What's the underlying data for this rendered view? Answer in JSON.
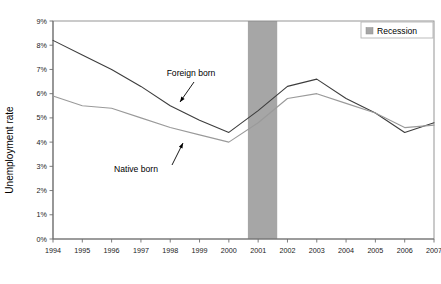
{
  "chart_data": {
    "type": "line",
    "title": "",
    "xlabel": "",
    "ylabel": "Unemployment rate",
    "x": [
      1994,
      1995,
      1996,
      1997,
      1998,
      1999,
      2000,
      2001,
      2002,
      2003,
      2004,
      2005,
      2006,
      2007
    ],
    "xtick_labels": [
      "1994",
      "1995",
      "1996",
      "1997",
      "1998",
      "1999",
      "2000",
      "2001",
      "2002",
      "2003",
      "2004",
      "2005",
      "2006",
      "2007"
    ],
    "ytick_labels": [
      "0%",
      "1%",
      "2%",
      "3%",
      "4%",
      "5%",
      "6%",
      "7%",
      "8%",
      "9%"
    ],
    "ytick_values": [
      0,
      1,
      2,
      3,
      4,
      5,
      6,
      7,
      8,
      9
    ],
    "ylim": [
      0,
      9
    ],
    "xlim": [
      1994,
      2007
    ],
    "grid": false,
    "legend_position": "top-right",
    "series": [
      {
        "name": "Foreign born",
        "color": "#3d3d3d",
        "values": [
          8.2,
          7.6,
          7.0,
          6.3,
          5.5,
          4.9,
          4.4,
          5.3,
          6.3,
          6.6,
          5.8,
          5.2,
          4.4,
          4.8
        ]
      },
      {
        "name": "Native born",
        "color": "#9a9a9a",
        "values": [
          5.9,
          5.5,
          5.4,
          5.0,
          4.6,
          4.3,
          4.0,
          4.8,
          5.8,
          6.0,
          5.6,
          5.2,
          4.6,
          4.7
        ]
      }
    ],
    "shaded_regions": [
      {
        "name": "Recession",
        "x_start": 2000.65,
        "x_end": 2001.65,
        "color": "#a6a6a6"
      }
    ],
    "annotations": [
      {
        "name": "Foreign born",
        "text": "Foreign born",
        "text_x": 191,
        "text_y": 76,
        "arrow_from_x": 194,
        "arrow_from_y": 82,
        "arrow_to_x": 180,
        "arrow_to_y": 102
      },
      {
        "name": "Native born",
        "text": "Native born",
        "text_x": 136,
        "text_y": 172,
        "arrow_from_x": 172,
        "arrow_from_y": 165,
        "arrow_to_x": 183,
        "arrow_to_y": 143
      }
    ],
    "legend": {
      "entries": [
        {
          "label": "Recession",
          "swatch_color": "#a6a6a6"
        }
      ]
    }
  }
}
